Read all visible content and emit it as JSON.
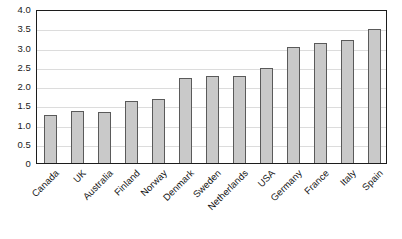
{
  "chart_data": {
    "type": "bar",
    "title": "",
    "subtitle": "",
    "xlabel": "",
    "ylabel": "",
    "categories": [
      "Canada",
      "UK",
      "Australia",
      "Finland",
      "Norway",
      "Denmark",
      "Sweden",
      "Netherlands",
      "USA",
      "Germany",
      "France",
      "Italy",
      "Spain"
    ],
    "values": [
      1.25,
      1.35,
      1.33,
      1.6,
      1.65,
      2.2,
      2.27,
      2.26,
      2.48,
      3.02,
      3.12,
      3.2,
      3.47
    ],
    "ylim": [
      0,
      4.0
    ],
    "ytick_values": [
      0,
      0.5,
      1.0,
      1.5,
      2.0,
      2.5,
      3.0,
      3.5,
      4.0
    ],
    "ytick_labels": [
      "0",
      "0.5",
      "1.0",
      "1.5",
      "2.0",
      "2.5",
      "3.0",
      "3.5",
      "4.0"
    ],
    "grid": true,
    "legend": false,
    "legend_position": "none",
    "series": [
      {
        "name": "",
        "values": [
          1.25,
          1.35,
          1.33,
          1.6,
          1.65,
          2.2,
          2.27,
          2.26,
          2.48,
          3.02,
          3.12,
          3.2,
          3.47
        ]
      }
    ],
    "annotations": []
  },
  "style": {
    "bar_fill": "#c9c9c9",
    "bar_border": "#5a5a5a",
    "gridline_color": "#dcdcdc",
    "frame_color": "#1c1c1c",
    "text_color": "#141414",
    "background": "#ffffff"
  }
}
